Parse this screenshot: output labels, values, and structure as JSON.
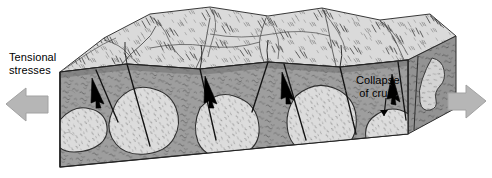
{
  "diagram": {
    "background_color": "#ffffff"
  },
  "labels": {
    "tensional": {
      "name": "tensional-stresses-label",
      "line1": "Tensional",
      "line2": "stresses"
    },
    "collapse": {
      "name": "collapse-of-crust-label",
      "line1": "Collapse",
      "line2": "of crust"
    }
  },
  "arrows": {
    "left": {
      "name": "left-tension-arrow",
      "direction": "left",
      "color": "#b3b3b3",
      "stroke": "#9a9a9a"
    },
    "right": {
      "name": "right-tension-arrow",
      "direction": "right",
      "color": "#b3b3b3",
      "stroke": "#9a9a9a"
    }
  },
  "block": {
    "name": "crustal-block",
    "top_surface": {
      "name": "mountainous-top-surface",
      "fill": "#d8d8d8",
      "description": "eroded mountainous terrain with hachured ridges"
    },
    "front_face": {
      "name": "front-cross-section",
      "fill": "#9e9e9e",
      "description": "metamorphic country rock cross-section"
    },
    "right_face": {
      "name": "right-cross-section",
      "fill": "#9a9a9a"
    },
    "plutons": {
      "name": "pluton-bodies",
      "fill": "#dcdcdc",
      "count": 5,
      "description": "light granitic intrusive bodies stippled"
    },
    "faults": {
      "name": "normal-fault-planes",
      "count": 6,
      "stroke": "#1a1a1a",
      "description": "normal faults dipping with downthrown blocks"
    },
    "fault_motion_arrows": {
      "name": "fault-motion-arrows",
      "count": 4,
      "color": "#000000",
      "description": "black arrows showing down-dip hanging wall motion"
    },
    "outline_stroke": "#2b2b2b"
  },
  "colors": {
    "dark_rock": "#9e9e9e",
    "light_pluton": "#dcdcdc",
    "top_surface": "#d8d8d8",
    "arrow_gray": "#b3b3b3",
    "ink": "#1a1a1a"
  }
}
